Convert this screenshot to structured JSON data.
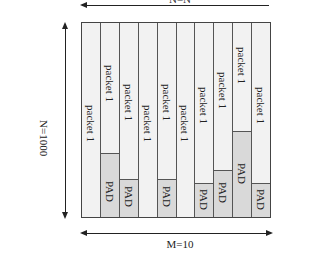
{
  "diagram": {
    "top_dimension": {
      "label": "N=N",
      "arrow_direction": "left"
    },
    "left_dimension": {
      "label": "N=1000",
      "arrow_direction": "both"
    },
    "bottom_dimension": {
      "label": "M=10",
      "arrow_direction": "both"
    },
    "packet_label": "packet 1",
    "pad_label": "PAD",
    "colors": {
      "packet_fill": "#f2f2f2",
      "pad_fill": "#d9d9d9",
      "border": "#555555"
    },
    "columns": [
      {
        "index": 1,
        "packet_label": "packet 1",
        "packet_label_top": 82,
        "pad_top": null,
        "pad_label": null
      },
      {
        "index": 2,
        "packet_label": "packet 1",
        "packet_label_top": 42,
        "pad_top": 130,
        "pad_label": "PAD",
        "pad_label_top": 158
      },
      {
        "index": 3,
        "packet_label": "packet 1",
        "packet_label_top": 61,
        "pad_top": 156,
        "pad_label": "PAD",
        "pad_label_top": 163
      },
      {
        "index": 4,
        "packet_label": "packet 1",
        "packet_label_top": 82,
        "pad_top": null,
        "pad_label": null
      },
      {
        "index": 5,
        "packet_label": "packet 1",
        "packet_label_top": 61,
        "pad_top": 156,
        "pad_label": "PAD",
        "pad_label_top": 163
      },
      {
        "index": 6,
        "packet_label": "packet 1",
        "packet_label_top": 82,
        "pad_top": null,
        "pad_label": null
      },
      {
        "index": 7,
        "packet_label": "packet 1",
        "packet_label_top": 64,
        "pad_top": 160,
        "pad_label": "PAD",
        "pad_label_top": 166
      },
      {
        "index": 8,
        "packet_label": "packet 1",
        "packet_label_top": 49,
        "pad_top": 147,
        "pad_label": "PAD",
        "pad_label_top": 159
      },
      {
        "index": 9,
        "packet_label": "packet 1",
        "packet_label_top": 24,
        "pad_top": 108,
        "pad_label": "PAD",
        "pad_label_top": 140
      },
      {
        "index": 10,
        "packet_label": "packet 1",
        "packet_label_top": 64,
        "pad_top": 160,
        "pad_label": "PAD",
        "pad_label_top": 166
      }
    ]
  }
}
